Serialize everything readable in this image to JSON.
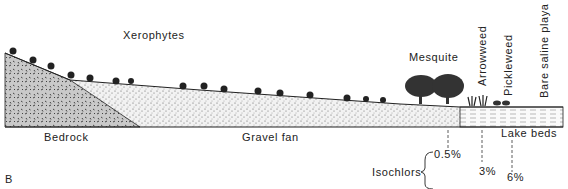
{
  "figure": {
    "panel_letter": "B",
    "vegetation_labels": {
      "xerophytes": "Xerophytes",
      "mesquite": "Mesquite",
      "arrowweed": "Arrowweed",
      "pickleweed": "Pickleweed",
      "bare_playa": "Bare saline playa"
    },
    "substrate_labels": {
      "bedrock": "Bedrock",
      "gravel_fan": "Gravel fan",
      "lake_beds": "Lake beds"
    },
    "isochlors": {
      "label": "Isochlors",
      "values": [
        "0.5%",
        "3%",
        "6%"
      ]
    },
    "colors": {
      "ink": "#222222",
      "background": "#ffffff"
    }
  }
}
